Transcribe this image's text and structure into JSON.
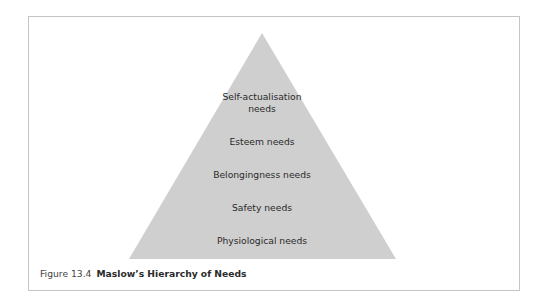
{
  "figure": {
    "number": "Figure 13.4",
    "title": "Maslow’s Hierarchy of Needs"
  },
  "pyramid": {
    "fill_color": "#cfcfcf",
    "levels": [
      {
        "label": "Self-actualisation",
        "label_line2": "needs"
      },
      {
        "label": "Esteem needs"
      },
      {
        "label": "Belongingness needs"
      },
      {
        "label": "Safety needs"
      },
      {
        "label": "Physiological needs"
      }
    ]
  }
}
